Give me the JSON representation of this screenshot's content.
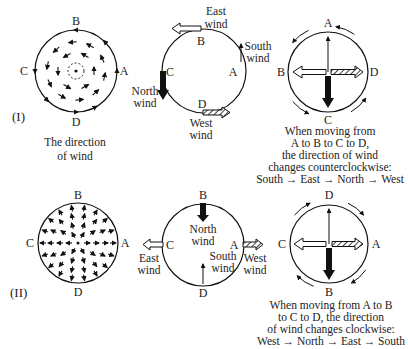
{
  "panels": [
    {
      "id": "I",
      "label": "(I)",
      "field_type": "rotation",
      "field_caption": [
        "The direction",
        "of wind"
      ],
      "points": {
        "top": "B",
        "left": "C",
        "right": "A",
        "bottom": "D"
      },
      "wind_circle": {
        "top": {
          "point": "B",
          "wind": [
            "East",
            "wind"
          ],
          "arrow": "east-wind-hollow",
          "direction": "left"
        },
        "right": {
          "point": "A",
          "wind": [
            "South",
            "wind"
          ],
          "arrow": "south-wind-thin",
          "direction": "up"
        },
        "left": {
          "point": "C",
          "wind": [
            "North",
            "wind"
          ],
          "arrow": "north-wind-solid",
          "direction": "down"
        },
        "bottom": {
          "point": "D",
          "wind": [
            "West",
            "wind"
          ],
          "arrow": "west-wind-hatched",
          "direction": "right"
        }
      },
      "compass": {
        "top": "A",
        "left": "B",
        "bottom": "C",
        "right": "D",
        "rotation": "counterclockwise"
      },
      "description": [
        "When moving from",
        "A to B to C to D,",
        "the direction of wind",
        "changes counterclockwise:",
        "South → East → North → West"
      ]
    },
    {
      "id": "II",
      "label": "(II)",
      "field_type": "divergence",
      "points": {
        "top": "B",
        "left": "C",
        "right": "A",
        "bottom": "D"
      },
      "wind_circle": {
        "top": {
          "point": "B",
          "wind": [
            "North",
            "wind"
          ],
          "arrow": "north-wind-solid",
          "direction": "down"
        },
        "right": {
          "point": "A",
          "wind": [
            "West",
            "wind"
          ],
          "arrow": "west-wind-hatched",
          "direction": "right"
        },
        "left": {
          "point": "C",
          "wind": [
            "East",
            "wind"
          ],
          "arrow": "east-wind-hollow",
          "direction": "left"
        },
        "bottom": {
          "point": "D",
          "wind": [
            "South",
            "wind"
          ],
          "arrow": "south-wind-thin",
          "direction": "up"
        }
      },
      "compass": {
        "top": "D",
        "left": "C",
        "bottom": "B",
        "right": "A",
        "rotation": "clockwise"
      },
      "description": [
        "When moving from A to B",
        "to C to D, the direction",
        "of wind changes clockwise:",
        "West → North → East → South"
      ]
    }
  ]
}
